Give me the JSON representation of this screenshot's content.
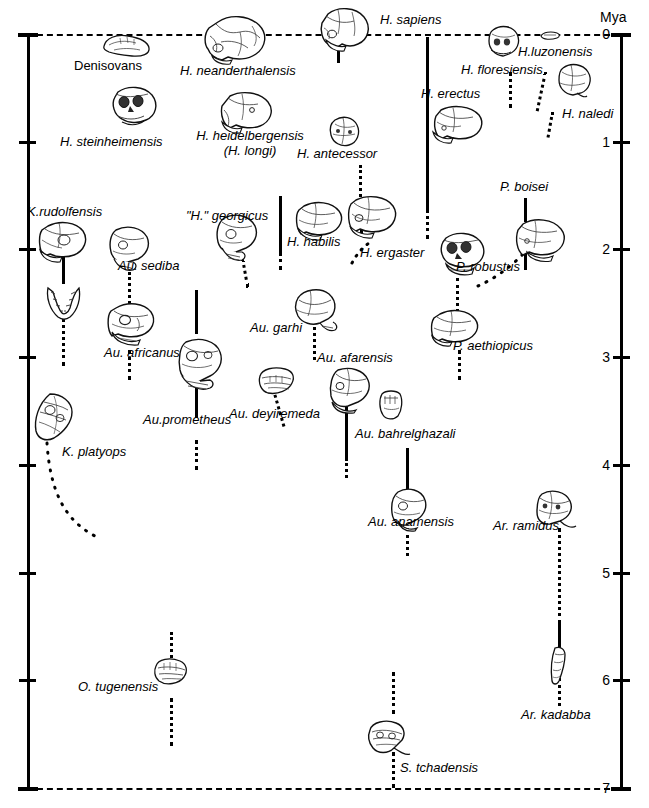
{
  "figure": {
    "axis_unit": "Mya",
    "tick_labels": [
      "0",
      "1",
      "2",
      "3",
      "4",
      "5",
      "6",
      "7"
    ],
    "axis_min": 0,
    "axis_max": 7,
    "colors": {
      "ink": "#000000",
      "background": "#ffffff"
    }
  },
  "chart_data": {
    "type": "timeline",
    "title": "",
    "ylabel": "Mya",
    "ylim": [
      0,
      7
    ],
    "grid": false,
    "legend": "none",
    "axis_ticks": [
      0,
      1,
      2,
      3,
      4,
      5,
      6,
      7
    ],
    "boundary_lines": [
      {
        "value": 0,
        "style": "dashed"
      },
      {
        "value": 7,
        "style": "dashed"
      }
    ],
    "taxa": [
      {
        "name": "Denisovans",
        "italic": false,
        "range_start": 0.0,
        "range_end": 0.0,
        "range_style": "none"
      },
      {
        "name": "H. neanderthalensis",
        "italic": true,
        "range_start": 0.0,
        "range_end": 0.0,
        "range_style": "none"
      },
      {
        "name": "H. sapiens",
        "italic": true,
        "range_start": 0.0,
        "range_end": 0.35,
        "range_style": "solid"
      },
      {
        "name": "H. steinheimensis",
        "italic": true,
        "range_start": 0.0,
        "range_end": 0.0,
        "range_style": "none"
      },
      {
        "name": "H. heidelbergensis (H. longi)",
        "italic": true,
        "range_start": 0.0,
        "range_end": 0.0,
        "range_style": "none"
      },
      {
        "name": "H. antecessor",
        "italic": true,
        "range_start": 1.25,
        "range_end": 1.65,
        "range_style": "dotted"
      },
      {
        "name": "H. erectus",
        "italic": true,
        "range_start": 0.05,
        "range_end": 1.95,
        "range_style": "solid"
      },
      {
        "name": "H. erectus (inferred)",
        "italic": true,
        "range_start": 1.95,
        "range_end": 2.25,
        "range_style": "dotted"
      },
      {
        "name": "H. floresiensis",
        "italic": true,
        "range_start": 0.45,
        "range_end": 0.8,
        "range_style": "dotted"
      },
      {
        "name": "H.luzonensis",
        "italic": true,
        "range_start": 0.4,
        "range_end": 0.8,
        "range_style": "dotted"
      },
      {
        "name": "H. naledi",
        "italic": true,
        "range_start": 0.0,
        "range_end": 0.0,
        "range_style": "none"
      },
      {
        "name": "P. boisei",
        "italic": true,
        "range_start": 1.3,
        "range_end": 1.6,
        "range_style": "solid"
      },
      {
        "name": "P. robustus",
        "italic": true,
        "range_start": 1.95,
        "range_end": 2.45,
        "range_style": "dotted"
      },
      {
        "name": "P. aethiopicus",
        "italic": true,
        "range_start": 2.85,
        "range_end": 3.25,
        "range_style": "dotted"
      },
      {
        "name": "K.rudolfensis",
        "italic": true,
        "range_start": 1.85,
        "range_end": 2.25,
        "range_style": "solid"
      },
      {
        "name": "\"H.\" georgicus",
        "italic": true,
        "range_start": 2.1,
        "range_end": 2.45,
        "range_style": "dotted"
      },
      {
        "name": "H. habilis",
        "italic": true,
        "range_start": 1.55,
        "range_end": 2.35,
        "range_style": "solid"
      },
      {
        "name": "H. ergaster",
        "italic": true,
        "range_start": 1.55,
        "range_end": 2.1,
        "range_style": "solid"
      },
      {
        "name": "Au. sediba",
        "italic": true,
        "range_start": 2.3,
        "range_end": 2.7,
        "range_style": "dotted"
      },
      {
        "name": "Au. africanus",
        "italic": true,
        "range_start": 2.75,
        "range_end": 3.15,
        "range_style": "dotted"
      },
      {
        "name": "Au. garhi",
        "italic": true,
        "range_start": 2.45,
        "range_end": 2.95,
        "range_style": "dotted"
      },
      {
        "name": "Au. afarensis",
        "italic": true,
        "range_start": 3.05,
        "range_end": 3.6,
        "range_style": "solid"
      },
      {
        "name": "Au.prometheus",
        "italic": true,
        "range_start": 2.55,
        "range_end": 3.95,
        "range_style": "solid"
      },
      {
        "name": "Au. deyiremeda",
        "italic": true,
        "range_start": 3.3,
        "range_end": 3.7,
        "range_style": "dotted"
      },
      {
        "name": "Au. bahrelghazali",
        "italic": true,
        "range_start": 3.45,
        "range_end": 3.95,
        "range_style": "solid"
      },
      {
        "name": "Au. anamensis",
        "italic": true,
        "range_start": 3.7,
        "range_end": 4.45,
        "range_style": "solid"
      },
      {
        "name": "K. platyops",
        "italic": true,
        "range_start": 3.3,
        "range_end": 4.4,
        "range_style": "dotted-curve"
      },
      {
        "name": "Ar. ramidus",
        "italic": true,
        "range_start": 4.2,
        "range_end": 5.6,
        "range_style": "dotted"
      },
      {
        "name": "Ar. kadabba",
        "italic": true,
        "range_start": 5.3,
        "range_end": 6.25,
        "range_style": "solid"
      },
      {
        "name": "O. tugenensis",
        "italic": true,
        "range_start": 5.25,
        "range_end": 6.4,
        "range_style": "dotted"
      },
      {
        "name": "S. tchadensis",
        "italic": true,
        "range_start": 6.0,
        "range_end": 7.0,
        "range_style": "dotted"
      }
    ]
  },
  "labels": {
    "denisovans": "Denisovans",
    "neanderthalensis": "H. neanderthalensis",
    "sapiens": "H. sapiens",
    "steinheimensis": "H. steinheimensis",
    "heidelbergensis_l1": "H. heidelbergensis",
    "heidelbergensis_l2": "(H. longi)",
    "antecessor": "H. antecessor",
    "erectus": "H. erectus",
    "floresiensis": "H. floresiensis",
    "luzonensis": "H.luzonensis",
    "naledi": "H. naledi",
    "boisei": "P. boisei",
    "robustus": "P. robustus",
    "aethiopicus": "P. aethiopicus",
    "rudolfensis": "K.rudolfensis",
    "georgicus": "\"H.\" georgicus",
    "habilis": "H. habilis",
    "ergaster": "H. ergaster",
    "sediba": "Au. sediba",
    "africanus": "Au. africanus",
    "garhi": "Au. garhi",
    "afarensis": "Au. afarensis",
    "prometheus": "Au.prometheus",
    "deyiremeda": "Au. deyiremeda",
    "bahrelghazali": "Au. bahrelghazali",
    "anamensis": "Au. anamensis",
    "platyops": "K. platyops",
    "ramidus": "Ar. ramidus",
    "kadabba": "Ar. kadabba",
    "tugenensis": "O. tugenensis",
    "tchadensis": "S. tchadensis"
  }
}
